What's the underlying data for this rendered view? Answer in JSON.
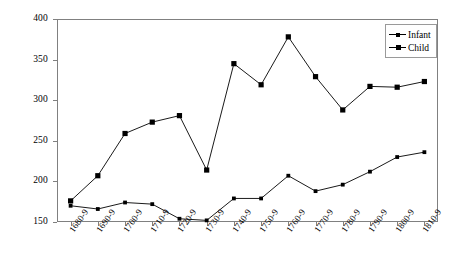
{
  "chart_data": {
    "type": "line",
    "title": "",
    "xlabel": "",
    "ylabel": "",
    "ylim": [
      150,
      400
    ],
    "yticks": [
      150,
      200,
      250,
      300,
      350,
      400
    ],
    "grid": false,
    "legend_position": "top-right",
    "categories": [
      "1680-9",
      "1690-9",
      "1700-9",
      "1710-9",
      "1720-9",
      "1730-9",
      "1740-9",
      "1750-9",
      "1760-9",
      "1770-9",
      "1780-9",
      "1790-9",
      "1800-9",
      "1810-9"
    ],
    "series": [
      {
        "name": "Infant",
        "marker": "small-square",
        "color": "#000000",
        "values": [
          170,
          166,
          174,
          172,
          154,
          152,
          179,
          179,
          207,
          188,
          196,
          212,
          230,
          236
        ]
      },
      {
        "name": "Child",
        "marker": "square",
        "color": "#000000",
        "values": [
          176,
          207,
          259,
          273,
          281,
          214,
          345,
          319,
          378,
          329,
          288,
          317,
          316,
          323
        ]
      }
    ]
  },
  "legend": {
    "items": [
      {
        "label": "Infant"
      },
      {
        "label": "Child"
      }
    ]
  },
  "axes": {
    "y_tick_labels": [
      "400",
      "350",
      "300",
      "250",
      "200",
      "150"
    ],
    "x_tick_labels": [
      "1680-9",
      "1690-9",
      "1700-9",
      "1710-9",
      "1720-9",
      "1730-9",
      "1740-9",
      "1750-9",
      "1760-9",
      "1770-9",
      "1780-9",
      "1790-9",
      "1800-9",
      "1810-9"
    ]
  }
}
